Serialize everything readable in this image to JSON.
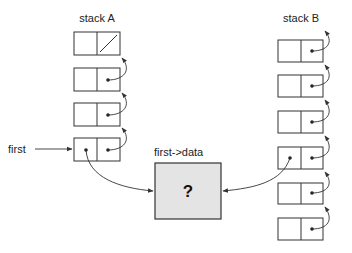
{
  "labels": {
    "stack_a": "stack A",
    "stack_b": "stack B",
    "first": "first",
    "first_data": "first->data",
    "data_value": "?"
  },
  "stack_a": {
    "node_count": 4,
    "top_node_null_link": true
  },
  "stack_b": {
    "node_count": 6,
    "shared_node_index": 3
  },
  "colors": {
    "line": "#333333",
    "data_fill": "#e4e4e4"
  }
}
